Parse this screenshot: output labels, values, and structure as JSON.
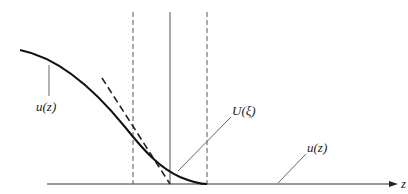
{
  "diagram": {
    "type": "profile-sketch",
    "axis": {
      "label": "z"
    },
    "labels": {
      "curve_left": "u(z)",
      "inner_solution": "U(ξ)",
      "curve_right": "u(z)"
    },
    "elements": [
      "solid curve u(z) decreasing to zero",
      "dashed tangent line meeting axis",
      "two dashed vertical lines bounding boundary layer",
      "solid vertical line at tangent intercept"
    ],
    "colors": {
      "stroke": "#222222",
      "thin": "#555555"
    }
  }
}
